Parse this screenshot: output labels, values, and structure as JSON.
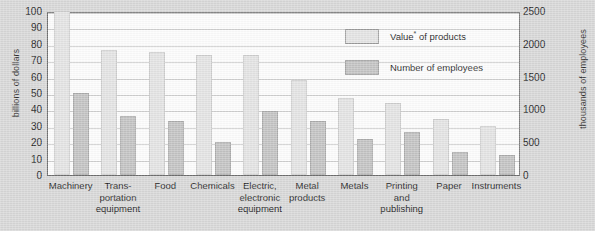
{
  "chart_data": {
    "type": "bar",
    "title": "",
    "categories": [
      "Machinery",
      "Transportation equipment",
      "Food",
      "Chemicals",
      "Electric, electronic equipment",
      "Metal products",
      "Metals",
      "Printing and publishing",
      "Paper",
      "Instruments"
    ],
    "category_lines": [
      [
        "Machinery",
        "",
        ""
      ],
      [
        "Trans-",
        "portation",
        "equipment"
      ],
      [
        "Food",
        "",
        ""
      ],
      [
        "Chemicals",
        "",
        ""
      ],
      [
        "Electric,",
        "electronic",
        "equipment"
      ],
      [
        "Metal",
        "products",
        ""
      ],
      [
        "Metals",
        "",
        ""
      ],
      [
        "Printing",
        "and",
        "publishing"
      ],
      [
        "Paper",
        "",
        ""
      ],
      [
        "Instruments",
        "",
        ""
      ]
    ],
    "series": [
      {
        "name": "Value* of products",
        "axis": "left",
        "unit": "billions of dollars",
        "color": "#e4e4e4",
        "values": [
          100,
          76,
          75,
          73,
          73,
          58,
          47,
          44,
          34,
          30
        ]
      },
      {
        "name": "Number of employees",
        "axis": "right",
        "unit": "thousands of employees",
        "color": "#c3c3c3",
        "values_left_scale": [
          50,
          36,
          33,
          20,
          39,
          33,
          22,
          26,
          14,
          12
        ],
        "values": [
          1250,
          900,
          825,
          500,
          975,
          825,
          550,
          650,
          350,
          300
        ]
      }
    ],
    "xlabel": "",
    "ylabel": "billions of dollars",
    "ylabel_right": "thousands of employees",
    "ylim": [
      0,
      100
    ],
    "ylim_right": [
      0,
      2500
    ],
    "yticks": [
      0,
      10,
      20,
      30,
      40,
      50,
      60,
      70,
      80,
      90,
      100
    ],
    "yticks_right": [
      0,
      500,
      1000,
      1500,
      2000,
      2500
    ],
    "grid": true,
    "legend_position": "upper right"
  },
  "axes": {
    "left_title": "billions of dollars",
    "right_title": "thousands of employees",
    "left_ticks": [
      "100",
      "90",
      "80",
      "70",
      "60",
      "50",
      "40",
      "30",
      "20",
      "10",
      "0"
    ],
    "right_ticks": [
      "2500",
      "2000",
      "1500",
      "1000",
      "500",
      "0"
    ]
  },
  "legend": {
    "items": [
      {
        "label": "Value",
        "sup": "*",
        "rest": " of products",
        "swatch": "value-swatch"
      },
      {
        "label": "Number of employees",
        "sup": "",
        "rest": "",
        "swatch": "employees-swatch"
      }
    ]
  },
  "colors": {
    "background": "#d8d8d8",
    "plot_background": "#fdfdfd",
    "value_bar": "#e4e4e4",
    "employee_bar": "#c3c3c3",
    "gridline": "#cfcfcf",
    "frame": "#6e6e6e"
  }
}
